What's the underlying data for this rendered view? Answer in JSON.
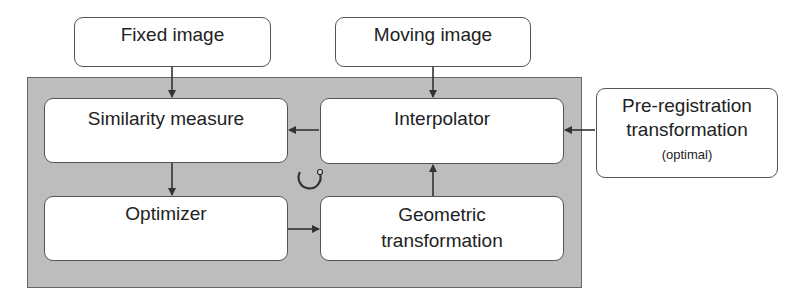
{
  "diagram": {
    "inputs": {
      "fixed_image": "Fixed image",
      "moving_image": "Moving image"
    },
    "components": {
      "similarity_measure": "Similarity measure",
      "interpolator": "Interpolator",
      "optimizer": "Optimizer",
      "geometric_transformation_line1": "Geometric",
      "geometric_transformation_line2": "transformation"
    },
    "pre_registration": {
      "line1": "Pre-registration",
      "line2": "transformation",
      "note": "(optimal)"
    },
    "loop_icon": "iteration-loop-icon",
    "colors": {
      "panel": "#bdbdbd",
      "box_border": "#555555",
      "arrow": "#333333"
    },
    "edges": [
      {
        "from": "Fixed image",
        "to": "Similarity measure"
      },
      {
        "from": "Moving image",
        "to": "Interpolator"
      },
      {
        "from": "Interpolator",
        "to": "Similarity measure"
      },
      {
        "from": "Pre-registration transformation",
        "to": "Interpolator"
      },
      {
        "from": "Similarity measure",
        "to": "Optimizer"
      },
      {
        "from": "Optimizer",
        "to": "Geometric transformation"
      },
      {
        "from": "Geometric transformation",
        "to": "Interpolator"
      }
    ]
  }
}
